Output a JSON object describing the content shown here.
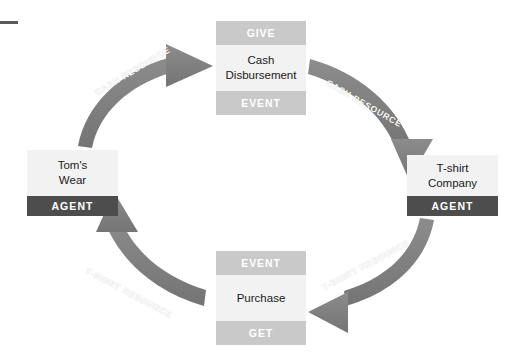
{
  "diagram": {
    "colors": {
      "arrow": "#808080",
      "band_light": "#c9c9c9",
      "band_dark": "#4d4d4d",
      "body_fill": "#f2f2f2",
      "text_dark": "#1a1a1a",
      "text_light": "#ffffff",
      "background": "#ffffff"
    },
    "nodes": [
      {
        "id": "cash-disbursement",
        "position": "top",
        "top_band": "GIVE",
        "label_line1": "Cash",
        "label_line2": "Disbursement",
        "bottom_band": "EVENT"
      },
      {
        "id": "tshirt-company",
        "position": "right",
        "label_line1": "T-shirt",
        "label_line2": "Company",
        "bottom_band": "AGENT"
      },
      {
        "id": "purchase",
        "position": "bottom",
        "top_band": "EVENT",
        "label_line1": "Purchase",
        "label_line2": "",
        "bottom_band": "GET"
      },
      {
        "id": "toms-wear",
        "position": "left",
        "label_line1": "Tom's",
        "label_line2": "Wear",
        "bottom_band": "AGENT"
      }
    ],
    "arrows": [
      {
        "id": "toms-wear-to-cash-disbursement",
        "label": "CASH  RESOURCE",
        "from": "toms-wear",
        "to": "cash-disbursement",
        "direction": "clockwise"
      },
      {
        "id": "cash-disbursement-to-tshirt-company",
        "label": "CASH  RESOURCE",
        "from": "cash-disbursement",
        "to": "tshirt-company",
        "direction": "clockwise"
      },
      {
        "id": "tshirt-company-to-purchase",
        "label": "T-SHIRT  RESOURCE",
        "from": "tshirt-company",
        "to": "purchase",
        "direction": "clockwise"
      },
      {
        "id": "purchase-to-toms-wear",
        "label": "T-SHIRT  RESOURCE",
        "from": "purchase",
        "to": "toms-wear",
        "direction": "clockwise"
      }
    ]
  }
}
